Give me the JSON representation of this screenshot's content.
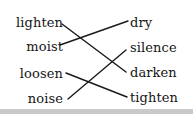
{
  "exercise": {
    "type": "matching-pairs",
    "left_column": {
      "items": [
        {
          "label": "lighten",
          "y": 22
        },
        {
          "label": "moist",
          "y": 46
        },
        {
          "label": "loosen",
          "y": 73
        },
        {
          "label": "noise",
          "y": 98
        }
      ]
    },
    "right_column": {
      "items": [
        {
          "label": "dry",
          "y": 22
        },
        {
          "label": "silence",
          "y": 47
        },
        {
          "label": "darken",
          "y": 72
        },
        {
          "label": "tighten",
          "y": 97
        }
      ]
    },
    "connections": [
      {
        "from": "lighten",
        "to": "darken",
        "x1": 62,
        "y1": 24,
        "x2": 126,
        "y2": 72
      },
      {
        "from": "moist",
        "to": "dry",
        "x1": 60,
        "y1": 45,
        "x2": 128,
        "y2": 21
      },
      {
        "from": "loosen",
        "to": "tighten",
        "x1": 66,
        "y1": 73,
        "x2": 127,
        "y2": 97
      },
      {
        "from": "noise",
        "to": "silence",
        "x1": 68,
        "y1": 99,
        "x2": 126,
        "y2": 50
      }
    ],
    "line_color": "#1a1a1a",
    "line_width": 1.4,
    "text_color": "#151515",
    "background_color": "#ffffff",
    "footer_band_color": "#c9c9c9"
  }
}
